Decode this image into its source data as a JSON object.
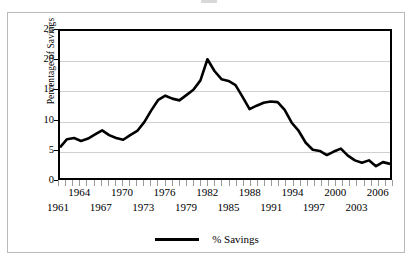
{
  "figure": {
    "background_color": "#ffffff",
    "frame_color": "#b9b9b9"
  },
  "chart_data": {
    "type": "line",
    "title": "",
    "subtitle": "",
    "xlabel": "",
    "ylabel": "Percentage of Savings",
    "xlim": [
      1961,
      2008
    ],
    "ylim": [
      0,
      25
    ],
    "y_ticks": [
      0,
      5,
      10,
      15,
      20,
      25
    ],
    "y_tick_labels": [
      "0",
      "5",
      "10",
      "15",
      "20",
      "25"
    ],
    "x_tick_labels_top": [
      "1964",
      "1970",
      "1976",
      "1982",
      "1988",
      "1994",
      "2000",
      "2006"
    ],
    "x_tick_labels_bottom": [
      "1961",
      "1967",
      "1973",
      "1979",
      "1985",
      "1991",
      "1997",
      "2003"
    ],
    "x_tick_years_top": [
      1964,
      1970,
      1976,
      1982,
      1988,
      1994,
      2000,
      2006
    ],
    "x_tick_years_bottom": [
      1961,
      1967,
      1973,
      1979,
      1985,
      1991,
      1997,
      2003
    ],
    "x_minor_tick_years": [
      1961,
      1962,
      1963,
      1964,
      1965,
      1966,
      1967,
      1968,
      1969,
      1970,
      1971,
      1972,
      1973,
      1974,
      1975,
      1976,
      1977,
      1978,
      1979,
      1980,
      1981,
      1982,
      1983,
      1984,
      1985,
      1986,
      1987,
      1988,
      1989,
      1990,
      1991,
      1992,
      1993,
      1994,
      1995,
      1996,
      1997,
      1998,
      1999,
      2000,
      2001,
      2002,
      2003,
      2004,
      2005,
      2006,
      2007,
      2008
    ],
    "grid": "horizontal",
    "legend_position": "bottom-center",
    "line_color": "#000000",
    "line_width": 2.6,
    "series": [
      {
        "name": "% Savings",
        "x": [
          1961,
          1962,
          1963,
          1964,
          1965,
          1966,
          1967,
          1968,
          1969,
          1970,
          1971,
          1972,
          1973,
          1974,
          1975,
          1976,
          1977,
          1978,
          1979,
          1980,
          1981,
          1982,
          1983,
          1984,
          1985,
          1986,
          1987,
          1988,
          1989,
          1990,
          1991,
          1992,
          1993,
          1994,
          1995,
          1996,
          1997,
          1998,
          1999,
          2000,
          2001,
          2002,
          2003,
          2004,
          2005,
          2006,
          2007,
          2008
        ],
        "values": [
          5.2,
          6.6,
          6.8,
          6.3,
          6.7,
          7.4,
          8.1,
          7.3,
          6.8,
          6.5,
          7.3,
          8.0,
          9.5,
          11.5,
          13.3,
          14.0,
          13.5,
          13.2,
          14.1,
          15.0,
          16.6,
          20.2,
          18.2,
          16.8,
          16.5,
          15.8,
          13.8,
          11.7,
          12.3,
          12.8,
          13.0,
          12.9,
          11.6,
          9.4,
          8.0,
          6.0,
          4.8,
          4.6,
          3.9,
          4.5,
          5.0,
          3.8,
          3.0,
          2.6,
          3.0,
          2.0,
          2.7,
          2.4
        ]
      }
    ]
  },
  "legend": {
    "entries": [
      {
        "label": "% Savings",
        "color": "#000000"
      }
    ]
  }
}
